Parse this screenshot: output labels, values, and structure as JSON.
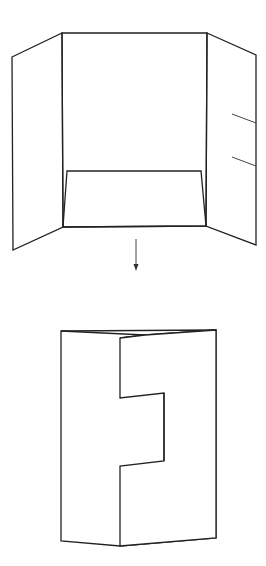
{
  "diagram": {
    "title": "",
    "colors": {
      "stroke": "#222222",
      "background": "#ffffff"
    },
    "open_folder": {
      "center_panel": {
        "x1": 62,
        "y1": 33,
        "x2": 207,
        "y2": 227
      },
      "left_flap": {
        "outer_top": [
          12,
          57
        ],
        "outer_bottom": [
          13,
          250
        ],
        "inner_top": [
          62,
          33
        ],
        "inner_bottom": [
          63,
          227
        ]
      },
      "right_flap": {
        "outer_top": [
          256,
          55
        ],
        "outer_bottom": [
          256,
          245
        ],
        "inner_top": [
          207,
          33
        ],
        "inner_bottom": [
          206,
          226
        ]
      },
      "pocket": {
        "top_left": [
          67,
          171
        ],
        "top_right": [
          201,
          171
        ],
        "bottom_left": [
          63,
          227
        ],
        "bottom_right": [
          206,
          226
        ]
      },
      "card_slits": [
        {
          "from": [
            232,
            114
          ],
          "to": [
            256,
            123
          ]
        },
        {
          "from": [
            232,
            157
          ],
          "to": [
            256,
            166
          ]
        }
      ]
    },
    "arrow": {
      "x": 136,
      "y_start": 239,
      "y_end": 270,
      "direction": "down"
    },
    "closed_folder": {
      "left_edge": {
        "x": 61,
        "y_top": 331,
        "y_bottom": 541
      },
      "right_edge": {
        "x": 216,
        "y_top": 330,
        "y_bottom": 538
      },
      "zigzag": [
        [
          120,
          338
        ],
        [
          120,
          398
        ],
        [
          164,
          393
        ],
        [
          164,
          461
        ],
        [
          120,
          466
        ],
        [
          120,
          546
        ]
      ]
    }
  }
}
